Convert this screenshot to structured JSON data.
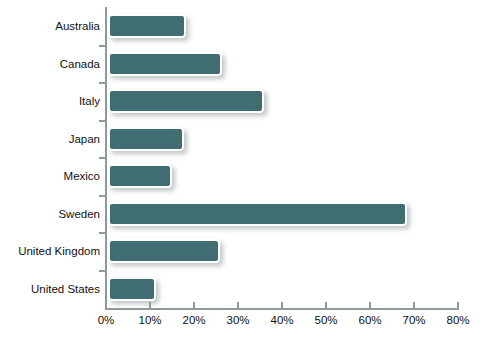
{
  "chart_data": {
    "type": "bar",
    "orientation": "horizontal",
    "title": "",
    "xlabel": "",
    "ylabel": "",
    "categories": [
      "Australia",
      "Canada",
      "Italy",
      "Japan",
      "Mexico",
      "Sweden",
      "United Kingdom",
      "United States"
    ],
    "values": [
      17.8,
      26.0,
      35.5,
      17.3,
      14.6,
      68.0,
      25.5,
      11.0
    ],
    "value_suffix": "%",
    "xlim": [
      0,
      80
    ],
    "xticks": [
      0,
      10,
      20,
      30,
      40,
      50,
      60,
      70,
      80
    ],
    "xtick_labels": [
      "0%",
      "10%",
      "20%",
      "30%",
      "40%",
      "50%",
      "60%",
      "70%",
      "80%"
    ],
    "grid": false,
    "legend": null,
    "series": [
      {
        "name": "",
        "color": "#3f6d72",
        "values": [
          17.8,
          26.0,
          35.5,
          17.3,
          14.6,
          68.0,
          25.5,
          11.0
        ]
      }
    ],
    "colors": {
      "bar_fill": "#3f6d72",
      "bar_border": "#ffffff",
      "axis": "#8e9a9c",
      "text": "#111111",
      "background": "#ffffff"
    }
  }
}
